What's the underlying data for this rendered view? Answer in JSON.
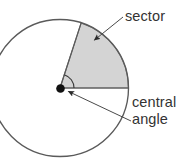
{
  "figure": {
    "type": "geometry-diagram",
    "background_color": "#ffffff"
  },
  "labels": {
    "sector": "sector",
    "central_line1": "central",
    "central_line2": "angle"
  },
  "colors": {
    "outline": "#5a5a5a",
    "sector_fill": "#d4d4d4",
    "sector_stroke": "#6a6a6a",
    "text": "#333333",
    "center_dot": "#111111",
    "leader": "#4a4a4a"
  },
  "geometry": {
    "circle": {
      "cx": 60,
      "cy": 88,
      "r": 68.5
    },
    "center_dot_radius": 4.2,
    "sector": {
      "start_angle_deg": 0,
      "end_angle_deg": 72,
      "radius": 68.5,
      "description": "shaded region between the horizontal radius and the upper radius"
    },
    "central_angle_arc": {
      "radius": 14,
      "start_angle_deg": 0,
      "end_angle_deg": 72
    },
    "radius_line_horizontal": {
      "x1": 60,
      "y1": 88,
      "x2": 128.5,
      "y2": 88
    },
    "radius_line_upper": {
      "x1": 60,
      "y1": 88,
      "x2": 81.2,
      "y2": 22.9
    },
    "leader_sector": {
      "x1": 124,
      "y1": 18,
      "x2": 94,
      "y2": 41
    },
    "leader_central_angle": {
      "x1": 60,
      "y1": 88,
      "x2": 132,
      "y2": 122
    }
  },
  "label_positions": {
    "sector": {
      "x": 125,
      "y": 21
    },
    "central_line1": {
      "x": 132,
      "y": 107
    },
    "central_line2": {
      "x": 132,
      "y": 124
    }
  }
}
